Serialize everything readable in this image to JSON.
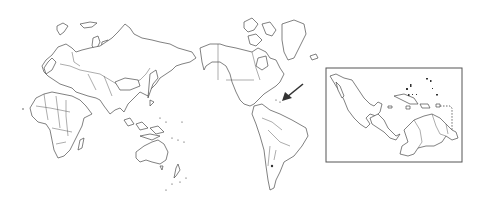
{
  "map": {
    "type": "world-outline-map",
    "projection": "pacific-centered",
    "line_color": "#4a4a4a",
    "background": "#ffffff",
    "highlight_region": "Caribbean / Central America",
    "arrow": {
      "points_to": "Caribbean Sea",
      "color": "#333333"
    },
    "inset": {
      "region": "Mexico, Central America, Caribbean and northern South America",
      "frame_color": "#555555"
    }
  }
}
